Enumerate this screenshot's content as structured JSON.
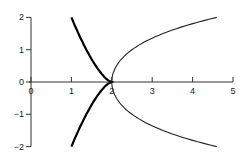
{
  "chart_data": {
    "type": "line",
    "title": "",
    "xlabel": "",
    "ylabel": "",
    "xlim": [
      0,
      5
    ],
    "ylim": [
      -2,
      2
    ],
    "grid": false,
    "legend": null,
    "x_ticks": [
      "0",
      "1",
      "2",
      "3",
      "4",
      "5"
    ],
    "y_ticks": [
      "2",
      "1",
      "0",
      "-1",
      "-2"
    ],
    "series": [
      {
        "name": "thick-curve",
        "line_width": "thick",
        "color": "#000000",
        "points": [
          [
            1.0,
            2.0
          ],
          [
            1.21,
            1.5
          ],
          [
            1.37,
            1.0
          ],
          [
            1.6,
            0.5
          ],
          [
            2.0,
            0.0
          ],
          [
            1.6,
            -0.5
          ],
          [
            1.37,
            -1.0
          ],
          [
            1.21,
            -1.5
          ],
          [
            1.0,
            -2.0
          ]
        ]
      },
      {
        "name": "thin-curve",
        "line_width": "thin",
        "color": "#222222",
        "points": [
          [
            4.6,
            2.0
          ],
          [
            3.27,
            1.5
          ],
          [
            2.5,
            1.0
          ],
          [
            2.12,
            0.5
          ],
          [
            2.0,
            0.0
          ],
          [
            2.12,
            -0.5
          ],
          [
            2.5,
            -1.0
          ],
          [
            3.27,
            -1.5
          ],
          [
            4.6,
            -2.0
          ]
        ]
      }
    ]
  }
}
